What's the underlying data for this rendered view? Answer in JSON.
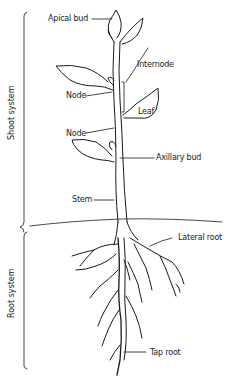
{
  "diagram": {
    "header_text": "",
    "systems": {
      "shoot": "Shoot system",
      "root": "Root system"
    },
    "labels": {
      "apical_bud": "Apical bud",
      "internode": "Internode",
      "node_upper": "Node",
      "leaf": "Leaf",
      "node_lower": "Node",
      "axillary_bud": "Axillary bud",
      "stem": "Stem",
      "lateral_root": "Lateral root",
      "tap_root": "Tap root"
    },
    "colors": {
      "line": "#1a1a1a",
      "background": "#ffffff"
    }
  }
}
